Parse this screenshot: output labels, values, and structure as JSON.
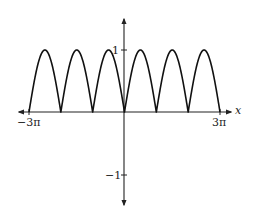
{
  "chart_data": {
    "type": "line",
    "title": "",
    "function": "y = |sin x|",
    "xlabel": "x",
    "ylabel": "",
    "xlim": [
      -9.42477796,
      9.42477796
    ],
    "ylim": [
      -1.5,
      1.5
    ],
    "grid": false,
    "legend": null,
    "x_tick_labels": [
      "−3π",
      "3π"
    ],
    "x_tick_values": [
      -9.42477796,
      9.42477796
    ],
    "y_tick_labels": [
      "1",
      "−1"
    ],
    "y_tick_values": [
      1,
      -1
    ],
    "series": [
      {
        "name": "|sin x|",
        "x": [
          -9.4248,
          -8.6394,
          -7.854,
          -7.0686,
          -6.2832,
          -5.4978,
          -4.7124,
          -3.927,
          -3.1416,
          -2.3562,
          -1.5708,
          -0.7854,
          0,
          0.7854,
          1.5708,
          2.3562,
          3.1416,
          3.927,
          4.7124,
          5.4978,
          6.2832,
          7.0686,
          7.854,
          8.6394,
          9.4248
        ],
        "values": [
          0,
          0.707,
          1,
          0.707,
          0,
          0.707,
          1,
          0.707,
          0,
          0.707,
          1,
          0.707,
          0,
          0.707,
          1,
          0.707,
          0,
          0.707,
          1,
          0.707,
          0,
          0.707,
          1,
          0.707,
          0
        ]
      }
    ]
  },
  "labels": {
    "x_axis": "x",
    "x_min": "−3π",
    "x_max": "3π",
    "y_one": "1",
    "y_neg_one": "−1"
  }
}
